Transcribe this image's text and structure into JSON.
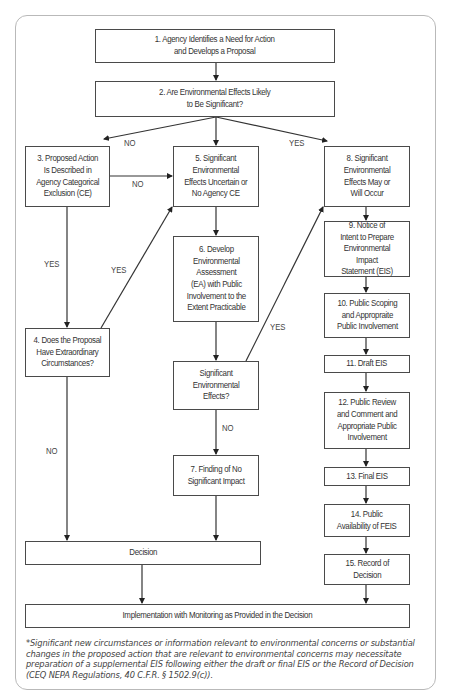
{
  "diagram": {
    "boxes": {
      "b1": "1. Agency Identifies a Need for Action\nand Develops a Proposal",
      "b2": "2. Are Environmental Effects Likely\nto Be Significant?",
      "b3": "3. Proposed Action\nIs Described in\nAgency Categorical\nExclusion (CE)",
      "b4": "4. Does the Proposal\nHave Extraordinary\nCircumstances?",
      "b5": "5. Significant\nEnvironmental\nEffects Uncertain or\nNo Agency CE",
      "b6": "6. Develop\nEnvironmental\nAssessment\n(EA) with Public\nInvolvement to the\nExtent Practicable",
      "bsig": "Significant\nEnvironmental\nEffects?",
      "b7": "7. Finding of No\nSignificant Impact",
      "b8": "8. Significant\nEnvironmental\nEffects May or\nWill Occur",
      "b9": "9. Notice of\nIntent to Prepare\nEnvironmental Impact\nStatement (EIS)",
      "b10": "10. Public Scoping\nand Appropraite\nPublic Involvement",
      "b11": "11. Draft EIS",
      "b12": "12. Public Review\nand Comment and\nAppropriate Public\nInvolvement",
      "b13": "13. Final EIS",
      "b14": "14. Public\nAvailability of FEIS",
      "b15": "15. Record of\nDecision",
      "decision": "Decision",
      "implementation": "Implementation with Monitoring as Provided in the Decision"
    },
    "labels": {
      "no_left": "NO",
      "yes_right": "YES",
      "no_3_to_5": "NO",
      "yes_3_to_4": "YES",
      "yes_4_to_5": "YES",
      "yes_sig_to_8": "YES",
      "no_sig_to_7": "NO",
      "no_4_to_decision": "NO"
    },
    "footnote": "*Significant new circumstances or information relevant to environmental concerns or substantial changes in the proposed action that are relevant to environmental concerns may necessitate preparation of a supplemental EIS following either the draft or final EIS or the Record of Decision (CEQ NEPA Regulations, 40 C.F.R. § 1502.9(c))."
  }
}
